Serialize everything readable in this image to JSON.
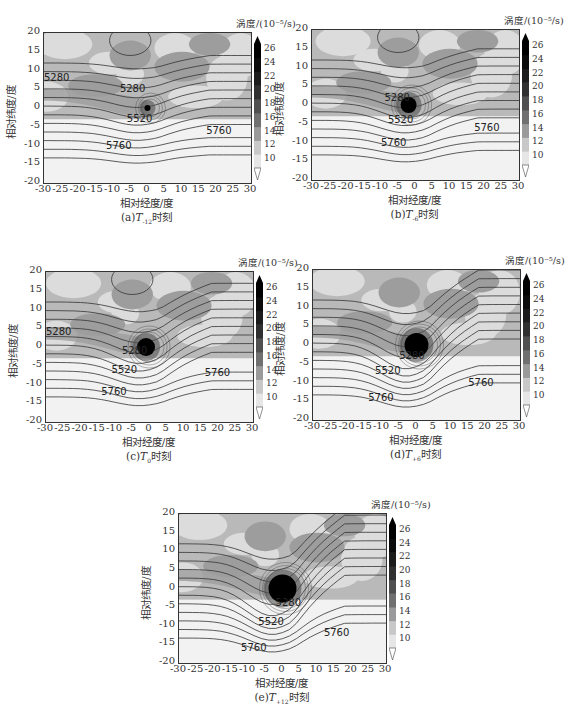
{
  "chart_data": [
    {
      "type": "heatmap",
      "panel": "a",
      "caption_prefix": "(a)",
      "caption_T": "T",
      "caption_sub": "-12",
      "caption_suffix": "时刻",
      "title": "(a)T-12时刻",
      "xlabel": "相对经度/度",
      "ylabel": "相对纬度/度",
      "xlim": [
        -30,
        30
      ],
      "ylim": [
        -20,
        20
      ],
      "xticks": [
        -30,
        -25,
        -20,
        -15,
        -10,
        -5,
        0,
        5,
        10,
        15,
        20,
        25,
        30
      ],
      "yticks": [
        20,
        15,
        10,
        5,
        0,
        -5,
        -10,
        -15,
        -20
      ],
      "colorbar_label": "涡度/(10⁻⁵/s)",
      "colorbar_ticks": [
        26,
        24,
        22,
        20,
        18,
        16,
        14,
        12,
        10
      ],
      "contour_labels": [
        "5280",
        "5280",
        "5520",
        "5760",
        "5760",
        "2",
        "2"
      ],
      "vortex_center": [
        0,
        0
      ],
      "vortex_peak_vorticity": 26
    },
    {
      "type": "heatmap",
      "panel": "b",
      "caption_prefix": "(b)",
      "caption_T": "T",
      "caption_sub": "-6",
      "caption_suffix": "时刻",
      "title": "(b)T-6时刻",
      "xlabel": "相对经度/度",
      "ylabel": "相对纬度/度",
      "xlim": [
        -30,
        30
      ],
      "ylim": [
        -20,
        20
      ],
      "xticks": [
        -30,
        -25,
        -20,
        -15,
        -10,
        -5,
        0,
        5,
        10,
        15,
        20,
        25,
        30
      ],
      "yticks": [
        20,
        15,
        10,
        5,
        0,
        -5,
        -10,
        -15,
        -20
      ],
      "colorbar_label": "涡度/(10⁻⁵/s)",
      "colorbar_ticks": [
        26,
        24,
        22,
        20,
        18,
        16,
        14,
        12,
        10
      ],
      "contour_labels": [
        "5280",
        "5520",
        "5760",
        "5760",
        "2",
        "4"
      ],
      "vortex_center": [
        -2,
        0
      ],
      "vortex_peak_vorticity": 26
    },
    {
      "type": "heatmap",
      "panel": "c",
      "caption_prefix": "(c)",
      "caption_T": "T",
      "caption_sub": "0",
      "caption_suffix": "时刻",
      "title": "(c)T0时刻",
      "xlabel": "相对经度/度",
      "ylabel": "相对纬度/度",
      "xlim": [
        -30,
        30
      ],
      "ylim": [
        -20,
        20
      ],
      "xticks": [
        -30,
        -25,
        -20,
        -15,
        -10,
        -5,
        0,
        5,
        10,
        15,
        20,
        25,
        30
      ],
      "yticks": [
        20,
        15,
        10,
        5,
        0,
        -5,
        -10,
        -15,
        -20
      ],
      "colorbar_label": "涡度/(10⁻⁵/s)",
      "colorbar_ticks": [
        26,
        24,
        22,
        20,
        18,
        16,
        14,
        12,
        10
      ],
      "contour_labels": [
        "5280",
        "5280",
        "5520",
        "5760",
        "5760",
        "2",
        "4",
        "2"
      ],
      "vortex_center": [
        -1,
        0
      ],
      "vortex_peak_vorticity": 26
    },
    {
      "type": "heatmap",
      "panel": "d",
      "caption_prefix": "(d)",
      "caption_T": "T",
      "caption_sub": "+6",
      "caption_suffix": "时刻",
      "title": "(d)T+6时刻",
      "xlabel": "相对经度/度",
      "ylabel": "相对纬度/度",
      "xlim": [
        -30,
        30
      ],
      "ylim": [
        -20,
        20
      ],
      "xticks": [
        -30,
        -25,
        -20,
        -15,
        -10,
        -5,
        0,
        5,
        10,
        15,
        20,
        25,
        30
      ],
      "yticks": [
        20,
        15,
        10,
        5,
        0,
        -5,
        -10,
        -15,
        -20
      ],
      "colorbar_label": "涡度/(10⁻⁵/s)",
      "colorbar_ticks": [
        26,
        24,
        22,
        20,
        18,
        16,
        14,
        12,
        10
      ],
      "contour_labels": [
        "5280",
        "5520",
        "5760",
        "5760",
        "2",
        "4",
        "8",
        "2"
      ],
      "vortex_center": [
        0,
        0
      ],
      "vortex_peak_vorticity": 26
    },
    {
      "type": "heatmap",
      "panel": "e",
      "caption_prefix": "(e)",
      "caption_T": "T",
      "caption_sub": "+12",
      "caption_suffix": "时刻",
      "title": "(e)T+12时刻",
      "xlabel": "相对经度/度",
      "ylabel": "相对纬度/度",
      "xlim": [
        -30,
        30
      ],
      "ylim": [
        -20,
        20
      ],
      "xticks": [
        -30,
        -25,
        -20,
        -15,
        -10,
        -5,
        0,
        5,
        10,
        15,
        20,
        25,
        30
      ],
      "yticks": [
        20,
        15,
        10,
        5,
        0,
        -5,
        -10,
        -15,
        -20
      ],
      "colorbar_label": "涡度/(10⁻⁵/s)",
      "colorbar_ticks": [
        26,
        24,
        22,
        20,
        18,
        16,
        14,
        12,
        10
      ],
      "contour_labels": [
        "5280",
        "5520",
        "5760",
        "5760",
        "2",
        "4",
        "8",
        "2"
      ],
      "vortex_center": [
        0,
        0
      ],
      "vortex_peak_vorticity": 26
    }
  ],
  "colors": {
    "background_fill": "#b9b9b9",
    "light_patch": "#dcdcdc",
    "dark_patch": "#9d9d9d",
    "white_band": "#f2f2f2",
    "vortex_core": "#000000",
    "contour": "#333333"
  }
}
